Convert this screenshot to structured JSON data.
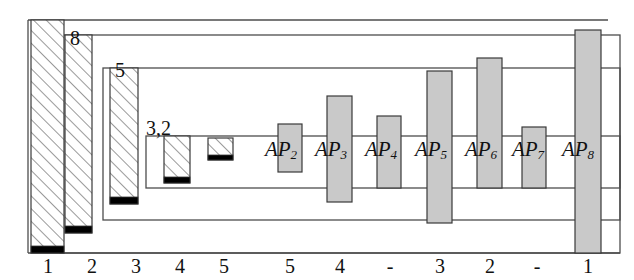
{
  "figure": {
    "type": "nested-frame-bar-diagram",
    "background_color": "#ffffff",
    "line_color": "#4d4d4d",
    "hatch_bar": {
      "fill": "#ffffff",
      "hatch_color": "#6b6b6b",
      "base_color": "#000000",
      "border_color": "#3a3a3a"
    },
    "solid_bar": {
      "fill": "#c9c9c9",
      "border_color": "#3a3a3a"
    }
  },
  "frames": [
    {
      "label": "8",
      "x": 60,
      "y": 35,
      "w": 560,
      "h": 218
    },
    {
      "label": "5",
      "x": 103,
      "y": 68,
      "w": 517,
      "h": 152
    },
    {
      "label": "3,2",
      "x": 146,
      "y": 136,
      "w": 474,
      "h": 52
    }
  ],
  "baseline": {
    "x1": 28,
    "x2": 620,
    "y": 253
  },
  "top_rule": {
    "x1": 28,
    "x2": 608,
    "y": 20
  },
  "left_edge": {
    "x": 28,
    "y1": 20,
    "y2": 253
  },
  "hatched_bars": [
    {
      "name": "bar-1",
      "tick": "1",
      "x": 31,
      "w": 33,
      "top": 20,
      "bottom": 253,
      "base_h": 7
    },
    {
      "name": "bar-2",
      "tick": "2",
      "x": 65,
      "w": 27,
      "top": 35,
      "bottom": 233,
      "base_h": 7
    },
    {
      "name": "bar-3",
      "tick": "3",
      "x": 110,
      "w": 28,
      "top": 68,
      "bottom": 204,
      "base_h": 7
    },
    {
      "name": "bar-4",
      "tick": "4",
      "x": 164,
      "w": 26,
      "top": 136,
      "bottom": 183,
      "base_h": 6
    },
    {
      "name": "bar-5",
      "tick": "5",
      "x": 208,
      "w": 25,
      "top": 138,
      "bottom": 160,
      "base_h": 5
    }
  ],
  "solid_bars": [
    {
      "name": "bar-ap2",
      "label": "AP",
      "sub": "2",
      "tick": "5",
      "x": 278,
      "w": 24,
      "top": 124,
      "bottom": 172
    },
    {
      "name": "bar-ap3",
      "label": "AP",
      "sub": "3",
      "tick": "4",
      "x": 327,
      "w": 25,
      "top": 96,
      "bottom": 202
    },
    {
      "name": "bar-ap4",
      "label": "AP",
      "sub": "4",
      "tick": "-",
      "x": 377,
      "w": 24,
      "top": 116,
      "bottom": 188
    },
    {
      "name": "bar-ap5",
      "label": "AP",
      "sub": "5",
      "tick": "3",
      "x": 427,
      "w": 25,
      "top": 71,
      "bottom": 223
    },
    {
      "name": "bar-ap6",
      "label": "AP",
      "sub": "6",
      "tick": "2",
      "x": 477,
      "w": 25,
      "top": 58,
      "bottom": 188
    },
    {
      "name": "bar-ap7",
      "label": "AP",
      "sub": "7",
      "tick": "-",
      "x": 522,
      "w": 24,
      "top": 127,
      "bottom": 188
    },
    {
      "name": "bar-ap8",
      "label": "AP",
      "sub": "8",
      "tick": "1",
      "x": 575,
      "w": 26,
      "top": 30,
      "bottom": 253
    }
  ],
  "ap_labels": [
    {
      "name": "ap-label-2",
      "text": "AP",
      "sub": "2",
      "cx": 281,
      "cy": 150
    },
    {
      "name": "ap-label-3",
      "text": "AP",
      "sub": "3",
      "cx": 331,
      "cy": 150
    },
    {
      "name": "ap-label-4",
      "text": "AP",
      "sub": "4",
      "cx": 381,
      "cy": 150
    },
    {
      "name": "ap-label-5",
      "text": "AP",
      "sub": "5",
      "cx": 431,
      "cy": 150
    },
    {
      "name": "ap-label-6",
      "text": "AP",
      "sub": "6",
      "cx": 481,
      "cy": 150
    },
    {
      "name": "ap-label-7",
      "text": "AP",
      "sub": "7",
      "cx": 528,
      "cy": 150
    },
    {
      "name": "ap-label-8",
      "text": "AP",
      "sub": "8",
      "cx": 578,
      "cy": 150
    }
  ],
  "frame_labels": [
    {
      "name": "frame-label-8",
      "text": "8",
      "x": 70,
      "y": 28
    },
    {
      "name": "frame-label-5",
      "text": "5",
      "x": 115,
      "y": 60
    },
    {
      "name": "frame-label-3-2",
      "text": "3,2",
      "x": 146,
      "y": 118
    }
  ],
  "axis": {
    "ticks": [
      {
        "name": "tick-1",
        "label": "1",
        "x": 48
      },
      {
        "name": "tick-2",
        "label": "2",
        "x": 92
      },
      {
        "name": "tick-3",
        "label": "3",
        "x": 136
      },
      {
        "name": "tick-4",
        "label": "4",
        "x": 180
      },
      {
        "name": "tick-5",
        "label": "5",
        "x": 224
      },
      {
        "name": "tick-6",
        "label": "5",
        "x": 290
      },
      {
        "name": "tick-7",
        "label": "4",
        "x": 340
      },
      {
        "name": "tick-8",
        "label": "-",
        "x": 390
      },
      {
        "name": "tick-9",
        "label": "3",
        "x": 440
      },
      {
        "name": "tick-10",
        "label": "2",
        "x": 490
      },
      {
        "name": "tick-11",
        "label": "-",
        "x": 537
      },
      {
        "name": "tick-12",
        "label": "1",
        "x": 588
      }
    ],
    "label_y": 256
  }
}
